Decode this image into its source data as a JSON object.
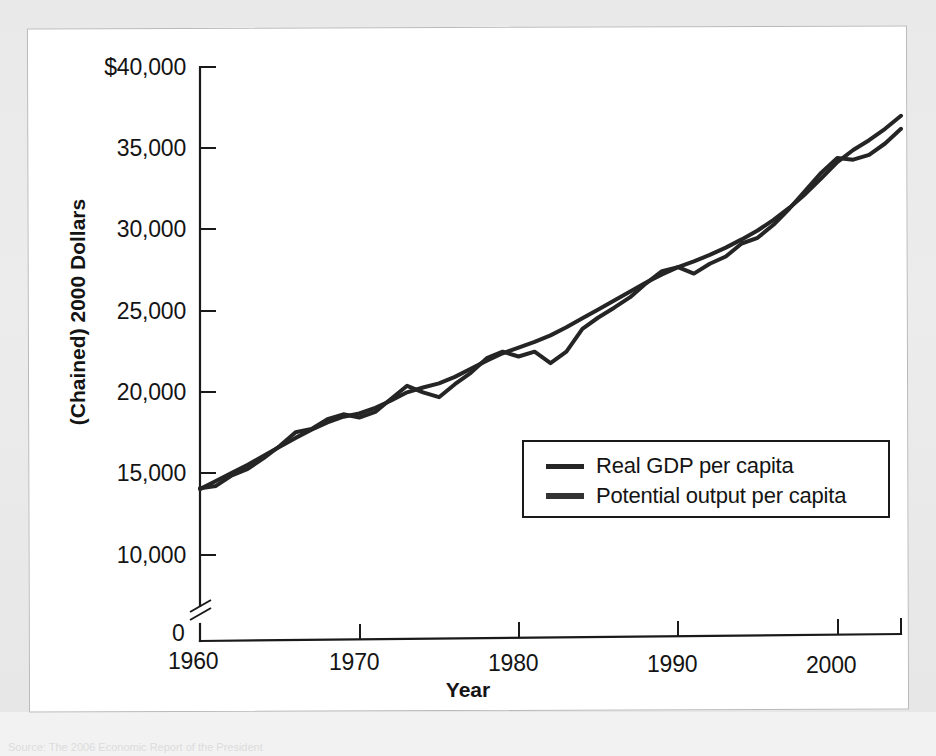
{
  "figure": {
    "caption_ghost": "Source: The 2006 Economic Report of the President"
  },
  "axes": {
    "ylabel": "(Chained) 2000 Dollars",
    "xlabel": "Year",
    "y_ticks": [
      "$40,000",
      "35,000",
      "30,000",
      "25,000",
      "20,000",
      "15,000",
      "10,000"
    ],
    "y_zero": "0",
    "x_ticks": [
      "1960",
      "1970",
      "1980",
      "1990",
      "2000"
    ],
    "axis_break": true
  },
  "legend": {
    "items": [
      {
        "label": "Real GDP per capita",
        "color": "#252525"
      },
      {
        "label": "Potential output per capita",
        "color": "#333333"
      }
    ]
  },
  "chart_data": {
    "type": "line",
    "title": "",
    "xlabel": "Year",
    "ylabel": "(Chained) 2000 Dollars",
    "xlim": [
      1960,
      2004
    ],
    "ylim": [
      10000,
      40000
    ],
    "ytick_values": [
      10000,
      15000,
      20000,
      25000,
      30000,
      35000,
      40000
    ],
    "xtick_values": [
      1960,
      1970,
      1980,
      1990,
      2000
    ],
    "grid": false,
    "legend_position": "center-right",
    "axis_break_below": 10000,
    "x": [
      1960,
      1961,
      1962,
      1963,
      1964,
      1965,
      1966,
      1967,
      1968,
      1969,
      1970,
      1971,
      1972,
      1973,
      1974,
      1975,
      1976,
      1977,
      1978,
      1979,
      1980,
      1981,
      1982,
      1983,
      1984,
      1985,
      1986,
      1987,
      1988,
      1989,
      1990,
      1991,
      1992,
      1993,
      1994,
      1995,
      1996,
      1997,
      1998,
      1999,
      2000,
      2001,
      2002,
      2003,
      2004
    ],
    "series": [
      {
        "name": "Real GDP per capita",
        "color": "#252525",
        "values": [
          14100,
          14250,
          14900,
          15300,
          15950,
          16700,
          17550,
          17750,
          18350,
          18650,
          18450,
          18800,
          19600,
          20400,
          20000,
          19700,
          20500,
          21200,
          22100,
          22500,
          22200,
          22500,
          21800,
          22500,
          23900,
          24600,
          25200,
          25850,
          26700,
          27450,
          27700,
          27300,
          27900,
          28350,
          29150,
          29500,
          30300,
          31300,
          32400,
          33500,
          34400,
          34300,
          34600,
          35300,
          36200
        ]
      },
      {
        "name": "Potential output per capita",
        "color": "#333333",
        "values": [
          14050,
          14550,
          15050,
          15550,
          16100,
          16650,
          17200,
          17700,
          18150,
          18500,
          18700,
          19050,
          19500,
          20000,
          20300,
          20550,
          20950,
          21450,
          21950,
          22400,
          22750,
          23100,
          23500,
          24000,
          24550,
          25100,
          25650,
          26200,
          26750,
          27250,
          27700,
          28050,
          28450,
          28900,
          29400,
          29950,
          30600,
          31350,
          32200,
          33150,
          34150,
          34900,
          35500,
          36200,
          37000
        ]
      }
    ],
    "annotations": [
      "Real GDP dips below potential during 1974-75 recession",
      "Real GDP dips below potential during 1982 recession",
      "Real GDP dips below potential during 1991 recession",
      "Real GDP dips below potential during 2001 recession"
    ]
  }
}
